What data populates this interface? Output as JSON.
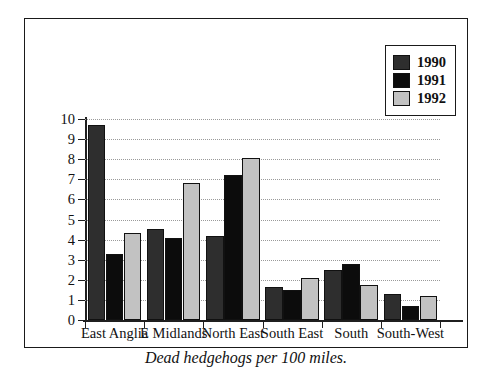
{
  "chart_data": {
    "type": "bar",
    "title": "",
    "caption": "Dead hedgehogs per 100 miles.",
    "xlabel": "",
    "ylabel": "",
    "ylim": [
      0,
      10
    ],
    "ytick_labels": [
      "10",
      "9",
      "8",
      "7",
      "6",
      "5",
      "4",
      "3",
      "2",
      "1",
      "0"
    ],
    "ytick_values": [
      10,
      9,
      8,
      7,
      6,
      5,
      4,
      3,
      2,
      1,
      0
    ],
    "grid": true,
    "grid_style": "dotted-horizontal",
    "legend_position": "top-right",
    "categories": [
      "East Anglia",
      "E Midlands",
      "North East",
      "South East",
      "South",
      "South-West"
    ],
    "series": [
      {
        "name": "1990",
        "color": "#2e2e2e",
        "values": [
          9.7,
          4.55,
          4.2,
          1.65,
          2.5,
          1.3
        ]
      },
      {
        "name": "1991",
        "color": "#0c0c0c",
        "values": [
          3.3,
          4.1,
          7.2,
          1.5,
          2.8,
          0.7
        ]
      },
      {
        "name": "1992",
        "color": "#c2c2c2",
        "values": [
          4.35,
          6.8,
          8.05,
          2.1,
          1.75,
          1.2
        ]
      }
    ]
  },
  "legend": {
    "items": [
      {
        "label": "1990",
        "color": "#2e2e2e"
      },
      {
        "label": "1991",
        "color": "#0c0c0c"
      },
      {
        "label": "1992",
        "color": "#c2c2c2"
      }
    ]
  },
  "colors": {
    "frame": "#1a1a1a",
    "axis": "#1f1f1f",
    "grid": "#9a9a9a",
    "background": "#ffffff",
    "text": "#111111"
  }
}
